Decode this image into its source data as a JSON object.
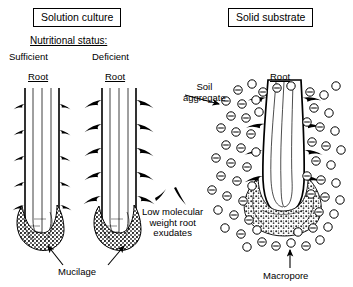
{
  "figure": {
    "panels": [
      {
        "id": "solution-culture",
        "title": "Solution culture",
        "subtitle": "Nutritional status:",
        "roots": [
          {
            "status": "Sufficient",
            "organ_label": "Root",
            "hair_density": "low",
            "hair_length": "short"
          },
          {
            "status": "Deficient",
            "organ_label": "Root",
            "hair_density": "high",
            "hair_length": "long"
          }
        ],
        "annotations": [
          {
            "name": "mucilage",
            "text": "Mucilage",
            "pointers": 2
          }
        ]
      },
      {
        "id": "solid-substrate",
        "title": "Solid substrate",
        "roots": [
          {
            "organ_label": "Root",
            "hair_density": "high",
            "hair_length": "long"
          }
        ],
        "annotations": [
          {
            "name": "soil-aggregate",
            "text": "Soil\naggregate",
            "line1": "Soil",
            "line2": "aggregate",
            "pointers": 1
          },
          {
            "name": "root-exudates",
            "line1": "Low molecular",
            "line2": "weight root",
            "line3": "exudates",
            "symbols": 2
          },
          {
            "name": "macropore",
            "text": "Macropore",
            "pointers": 1
          }
        ],
        "soil_aggregate_charge": "−"
      }
    ],
    "colors": {
      "ink": "#000000",
      "background": "#ffffff",
      "mucilage_fill": "#4a4a4a",
      "root_fill": "#ffffff"
    }
  }
}
